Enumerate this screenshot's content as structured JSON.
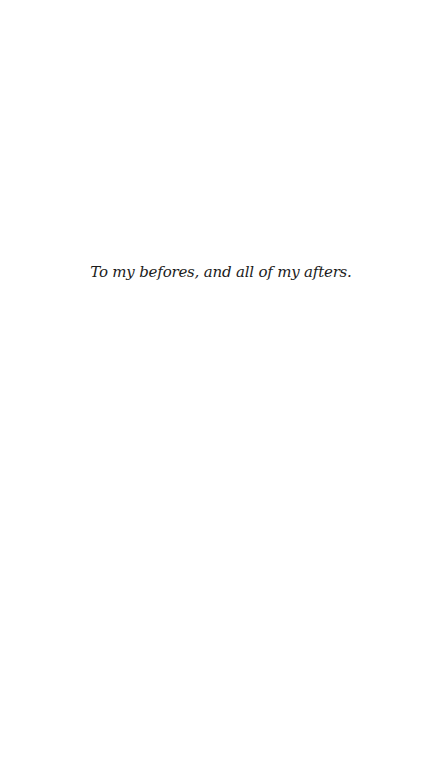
{
  "page": {
    "type": "dedication",
    "text": "To my befores, and all of my afters.",
    "background_color": "#ffffff",
    "text_color": "#1c1c1c"
  }
}
